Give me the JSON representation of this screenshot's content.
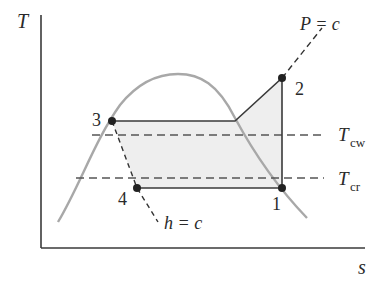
{
  "diagram": {
    "type": "T-s diagram (vapor-compression refrigeration cycle)",
    "axes": {
      "y_label": "T",
      "x_label": "s"
    },
    "states": [
      {
        "id": "1",
        "label": "1",
        "x": 282,
        "y": 188
      },
      {
        "id": "2",
        "label": "2",
        "x": 282,
        "y": 78
      },
      {
        "id": "3",
        "label": "3",
        "x": 112,
        "y": 121
      },
      {
        "id": "4",
        "label": "4",
        "x": 137,
        "y": 188
      }
    ],
    "annotations": {
      "pressure_line": "P = c",
      "enthalpy_line": "h = c",
      "t_cw_main": "T",
      "t_cw_sub": "cw",
      "t_cr_main": "T",
      "t_cr_sub": "cr"
    },
    "colors": {
      "axis": "#3a3a3a",
      "dome": "#a8a8a8",
      "cycle": "#3a3a3a",
      "fill": "#eeeeee",
      "dashed": "#555555",
      "points": "#222222"
    }
  }
}
